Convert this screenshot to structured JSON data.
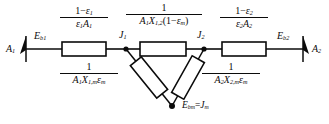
{
  "diagram": {
    "type": "resistance-network",
    "nodes": [
      {
        "id": "A1",
        "label": "A",
        "sub": "1",
        "x": 14,
        "y": 47
      },
      {
        "id": "Eb1",
        "label": "E",
        "sub": "b1",
        "x": 42,
        "y": 38
      },
      {
        "id": "J1",
        "label": "J",
        "sub": "1",
        "x": 122,
        "y": 37
      },
      {
        "id": "J2",
        "label": "J",
        "sub": "2",
        "x": 200,
        "y": 37
      },
      {
        "id": "Eb2",
        "label": "E",
        "sub": "b2",
        "x": 285,
        "y": 38
      },
      {
        "id": "A2",
        "label": "A",
        "sub": "2",
        "x": 315,
        "y": 47
      },
      {
        "id": "Ebm",
        "label": "E",
        "sub": "bm",
        "x": 188,
        "y": 107
      }
    ],
    "node_labels": {
      "surface_1": "A₁",
      "blackbody_emissive_power_1": "E_b1",
      "radiosity_1": "J₁",
      "radiosity_2": "J₂",
      "blackbody_emissive_power_2": "E_b2",
      "surface_2": "A₂",
      "medium": "E_bm = J_m"
    },
    "resistors": [
      {
        "id": "surface-resistance-1",
        "name": "surface resistance of surface 1",
        "numerator": "1 − ε₁",
        "denominator": "ε₁A₁",
        "num_parts": {
          "one": "1",
          "minus": "−",
          "eps": "ε",
          "eps_sub": "1"
        },
        "den_parts": {
          "eps": "ε",
          "eps_sub": "1",
          "area": "A",
          "area_sub": "1"
        },
        "orientation": "horizontal",
        "box": {
          "x": 62,
          "y": 42,
          "w": 44,
          "h": 14
        },
        "label_pos": {
          "x": 84,
          "y": 8
        }
      },
      {
        "id": "space-resistance-1-2",
        "name": "space resistance between surfaces 1 and 2 through medium",
        "numerator": "1",
        "denominator": "A₁X₁,₂(1 − ε_m)",
        "num_parts": {
          "one": "1"
        },
        "den_parts": {
          "area": "A",
          "area_sub": "1",
          "view": "X",
          "view_sub": "1,2",
          "open": "(",
          "one": "1",
          "minus": "−",
          "eps": "ε",
          "eps_sub": "m",
          "close": ")"
        },
        "orientation": "horizontal",
        "box": {
          "x": 140,
          "y": 42,
          "w": 46,
          "h": 14
        },
        "label_pos": {
          "x": 163,
          "y": 4
        }
      },
      {
        "id": "surface-resistance-2",
        "name": "surface resistance of surface 2",
        "numerator": "1 − ε₂",
        "denominator": "ε₂A₂",
        "num_parts": {
          "one": "1",
          "minus": "−",
          "eps": "ε",
          "eps_sub": "2"
        },
        "den_parts": {
          "eps": "ε",
          "eps_sub": "2",
          "area": "A",
          "area_sub": "2"
        },
        "orientation": "horizontal",
        "box": {
          "x": 222,
          "y": 42,
          "w": 44,
          "h": 14
        },
        "label_pos": {
          "x": 244,
          "y": 8
        }
      },
      {
        "id": "medium-resistance-1",
        "name": "resistance from surface 1 to medium",
        "numerator": "1",
        "denominator": "A₁X₁,mε_m",
        "num_parts": {
          "one": "1"
        },
        "den_parts": {
          "area": "A",
          "area_sub": "1",
          "view": "X",
          "view_sub": "1,m",
          "eps": "ε",
          "eps_sub": "m"
        },
        "orientation": "diagonal-left",
        "label_pos": {
          "x": 86,
          "y": 64
        }
      },
      {
        "id": "medium-resistance-2",
        "name": "resistance from surface 2 to medium",
        "numerator": "1",
        "denominator": "A₂X₂,mε_m",
        "num_parts": {
          "one": "1"
        },
        "den_parts": {
          "area": "A",
          "area_sub": "2",
          "view": "X",
          "view_sub": "2,m",
          "eps": "ε",
          "eps_sub": "m"
        },
        "orientation": "diagonal-right",
        "label_pos": {
          "x": 228,
          "y": 64
        }
      }
    ],
    "medium_equation": {
      "left": "E",
      "left_sub": "bm",
      "equals": "=",
      "right": "J",
      "right_sub": "m"
    },
    "colors": {
      "line": "#0b0b0b",
      "background": "#ffffff",
      "text": "#0b0b0b"
    }
  }
}
